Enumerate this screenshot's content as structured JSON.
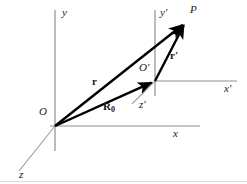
{
  "figure": {
    "type": "vector-diagram",
    "canvas": {
      "width": 247,
      "height": 184,
      "background": "#ffffff"
    },
    "colors": {
      "axis": "#8c8c8c",
      "vector": "#000000",
      "label": "#1a1a1a",
      "baseline": "#d8d8d8"
    },
    "axes": [
      {
        "id": "y-axis",
        "label": "y",
        "frame": "unprimed",
        "orientation": "vertical",
        "from": [
          55,
          10
        ],
        "to": [
          55,
          151
        ],
        "label_pos": [
          62,
          8
        ]
      },
      {
        "id": "x-axis",
        "label": "x",
        "frame": "unprimed",
        "orientation": "horizontal",
        "from": [
          50,
          126
        ],
        "to": [
          200,
          126
        ],
        "label_pos": [
          173,
          128
        ]
      },
      {
        "id": "z-axis",
        "label": "z",
        "frame": "unprimed",
        "orientation": "oblique",
        "from": [
          55,
          126
        ],
        "to": [
          19,
          171
        ],
        "label_pos": [
          19,
          171
        ]
      },
      {
        "id": "y-prime-axis",
        "label": "y′",
        "frame": "primed",
        "orientation": "vertical",
        "from": [
          155,
          10
        ],
        "to": [
          155,
          96
        ],
        "label_pos": [
          160,
          8
        ]
      },
      {
        "id": "x-prime-axis",
        "label": "x′",
        "frame": "primed",
        "orientation": "horizontal",
        "from": [
          155,
          81
        ],
        "to": [
          237,
          81
        ],
        "label_pos": [
          224,
          84
        ]
      },
      {
        "id": "z-prime-axis",
        "label": "z′",
        "frame": "primed",
        "orientation": "oblique",
        "from": [
          155,
          81
        ],
        "to": [
          132,
          104
        ],
        "label_pos": [
          139,
          101
        ]
      }
    ],
    "points": [
      {
        "id": "origin-O",
        "label": "O",
        "pos": [
          55,
          126
        ],
        "label_pos": [
          39,
          107
        ]
      },
      {
        "id": "origin-O-prime",
        "label": "O′",
        "pos": [
          155,
          81
        ],
        "label_pos": [
          139,
          63
        ]
      },
      {
        "id": "point-P",
        "label": "P",
        "pos": [
          186,
          22
        ],
        "label_pos": [
          190,
          5
        ]
      }
    ],
    "vectors": [
      {
        "id": "vector-r",
        "label": "r",
        "prime": false,
        "from": [
          55,
          126
        ],
        "to": [
          186,
          22
        ],
        "label_pos": [
          92,
          77
        ],
        "style": "bold-arrow"
      },
      {
        "id": "vector-R0",
        "label": "R",
        "subscript": "0",
        "prime": false,
        "from": [
          55,
          126
        ],
        "to": [
          155,
          81
        ],
        "label_pos": [
          103,
          102
        ],
        "style": "bold-arrow"
      },
      {
        "id": "vector-r-prime",
        "label": "r",
        "prime": true,
        "from": [
          155,
          81
        ],
        "to": [
          186,
          22
        ],
        "label_pos": [
          170,
          51
        ],
        "style": "bold-arrow"
      }
    ]
  }
}
